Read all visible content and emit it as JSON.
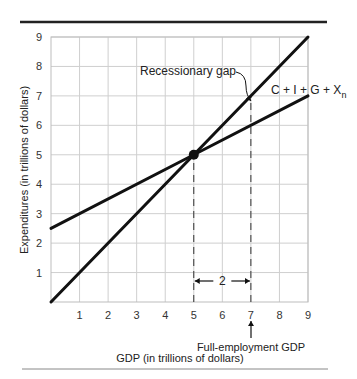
{
  "chart_data": {
    "type": "line",
    "title": "",
    "xlabel": "GDP (in trillions of dollars)",
    "ylabel": "Expenditures (in trillions of dollars)",
    "xlim": [
      0,
      9
    ],
    "ylim": [
      0,
      9
    ],
    "x_ticks": [
      "1",
      "2",
      "3",
      "4",
      "5",
      "6",
      "7",
      "8",
      "9"
    ],
    "y_ticks": [
      "1",
      "2",
      "3",
      "4",
      "5",
      "6",
      "7",
      "8",
      "9"
    ],
    "grid": true,
    "series": [
      {
        "name": "45-degree line",
        "x": [
          0,
          9
        ],
        "y": [
          0,
          9
        ]
      },
      {
        "name": "C + I + G + Xn",
        "x": [
          0,
          5,
          9
        ],
        "y": [
          2.5,
          5,
          7
        ]
      }
    ],
    "equilibrium_point": {
      "x": 5,
      "y": 5
    },
    "annotations": [
      {
        "text": "Recessionary gap",
        "target": {
          "x": 7,
          "y": 7
        }
      },
      {
        "text": "C + I + G + X",
        "subscript": "n"
      },
      {
        "text": "2",
        "type": "span-arrow",
        "from_x": 5,
        "to_x": 7
      },
      {
        "text": "Full-employment GDP",
        "target_x": 7
      }
    ],
    "dashed_lines": [
      {
        "x": 5,
        "from_y": 0,
        "to_y": 5
      },
      {
        "x": 7,
        "from_y": 0,
        "to_y": 7
      }
    ]
  },
  "labels": {
    "ylabel": "Expenditures (in trillions of dollars)",
    "xlabel": "GDP (in trillions of dollars)",
    "recessionary_gap": "Recessionary gap",
    "ae_line": "C + I + G + X",
    "ae_line_sub": "n",
    "gap_width": "2",
    "full_employment": "Full-employment GDP"
  }
}
